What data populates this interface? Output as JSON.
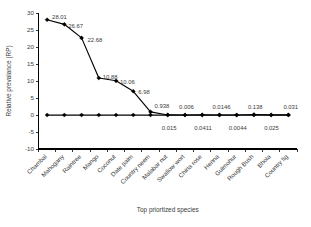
{
  "chart_data": {
    "type": "line",
    "title": "",
    "xlabel": "Top priortized species",
    "ylabel": "Relative prevalance (RP)",
    "ylim": [
      -10,
      30
    ],
    "ytick_values": [
      30,
      25,
      20,
      15,
      10,
      5,
      0,
      -5,
      -10
    ],
    "grid": false,
    "legend": "none",
    "categories": [
      "Chambal",
      "Mahogany",
      "Raintree",
      "Mango",
      "Coconut",
      "Date palm",
      "Country neem",
      "Malabar nut",
      "Swallow wort",
      "China rose",
      "Henna",
      "Gulmohur",
      "Rough Bush",
      "Bhola",
      "Country fig"
    ],
    "series": [
      {
        "name": "Relative prevalance (RP)",
        "marker": "diamond",
        "values": [
          28.01,
          26.67,
          22.68,
          10.88,
          10.06,
          6.98,
          0.938,
          0.015,
          0.006,
          0.0411,
          0.0146,
          0.0044,
          0.138,
          0.025,
          0.031
        ]
      },
      {
        "name": "baseline",
        "marker": "diamond",
        "values": [
          0,
          0,
          0,
          0,
          0,
          0,
          0,
          0,
          0,
          0,
          0,
          0,
          0,
          0,
          0
        ]
      }
    ],
    "point_labels": [
      {
        "index": 0,
        "text": "28.01",
        "dx": 5,
        "dy": -1
      },
      {
        "index": 1,
        "text": "26.67",
        "dx": 4,
        "dy": 4
      },
      {
        "index": 2,
        "text": "22.68",
        "dx": 6,
        "dy": 4
      },
      {
        "index": 3,
        "text": "10.88",
        "dx": 4,
        "dy": 1
      },
      {
        "index": 4,
        "text": "10.06",
        "dx": 4,
        "dy": 3
      },
      {
        "index": 5,
        "text": "6.98",
        "dx": 5,
        "dy": 3
      },
      {
        "index": 6,
        "text": "0.938",
        "dx": 4,
        "dy": -4
      },
      {
        "index": 7,
        "text": "0.015",
        "dx": -6,
        "dy": 15
      },
      {
        "index": 8,
        "text": "0.006",
        "dx": -6,
        "dy": -6
      },
      {
        "index": 9,
        "text": "0.0411",
        "dx": -8,
        "dy": 15
      },
      {
        "index": 10,
        "text": "0.0146",
        "dx": -7,
        "dy": -6
      },
      {
        "index": 11,
        "text": "0.0044",
        "dx": -8,
        "dy": 15
      },
      {
        "index": 12,
        "text": "0.138",
        "dx": -6,
        "dy": -6
      },
      {
        "index": 13,
        "text": "0.025",
        "dx": -7,
        "dy": 15
      },
      {
        "index": 14,
        "text": "0.031",
        "dx": -5,
        "dy": -6
      }
    ],
    "colors": {
      "line": "#000000",
      "marker": "#000000",
      "axis": "#000000",
      "text": "#3a3a3a",
      "background": "#ffffff"
    }
  }
}
